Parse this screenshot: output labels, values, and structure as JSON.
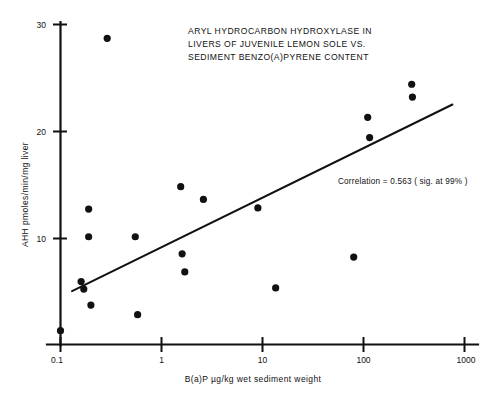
{
  "chart_data": {
    "type": "scatter",
    "title": "ARYL HYDROCARBON HYDROXYLASE IN LIVERS OF JUVENILE LEMON SOLE VS. SEDIMENT BENZO(A)PYRENE CONTENT",
    "title_lines": [
      "ARYL HYDROCARBON HYDROXYLASE IN",
      "LIVERS OF JUVENILE LEMON SOLE VS.",
      "SEDIMENT BENZO(A)PYRENE CONTENT"
    ],
    "xlabel": "B(a)P µg/kg wet sediment weight",
    "ylabel": "AHH  pmoles/min/mg liver",
    "xscale": "log",
    "yscale": "linear",
    "xlim": [
      0.1,
      1000
    ],
    "ylim": [
      0,
      30
    ],
    "xticks": [
      0.1,
      1,
      10,
      100,
      1000
    ],
    "xticklabels": [
      "0.1",
      "1",
      "10",
      "100",
      "1000"
    ],
    "yticks": [
      10,
      20,
      30
    ],
    "yticklabels": [
      "10",
      "20",
      "30"
    ],
    "grid": false,
    "legend": null,
    "annotation": "Correlation = 0.563 ( sig. at 99% )",
    "annotation_value": 0.563,
    "significance": "99%",
    "marker": "filled-circle",
    "marker_color": "#111111",
    "line_color": "#111111",
    "points": [
      {
        "x": 0.1,
        "y": 1.3
      },
      {
        "x": 0.16,
        "y": 5.9
      },
      {
        "x": 0.17,
        "y": 5.2
      },
      {
        "x": 0.19,
        "y": 12.7
      },
      {
        "x": 0.19,
        "y": 10.1
      },
      {
        "x": 0.2,
        "y": 3.7
      },
      {
        "x": 0.29,
        "y": 28.7
      },
      {
        "x": 0.55,
        "y": 10.1
      },
      {
        "x": 0.58,
        "y": 2.8
      },
      {
        "x": 1.55,
        "y": 14.8
      },
      {
        "x": 1.6,
        "y": 8.5
      },
      {
        "x": 1.7,
        "y": 6.8
      },
      {
        "x": 2.6,
        "y": 13.6
      },
      {
        "x": 9.0,
        "y": 12.8
      },
      {
        "x": 13.5,
        "y": 5.3
      },
      {
        "x": 80.0,
        "y": 8.2
      },
      {
        "x": 110.0,
        "y": 21.3
      },
      {
        "x": 115.0,
        "y": 19.4
      },
      {
        "x": 300.0,
        "y": 24.4
      },
      {
        "x": 305.0,
        "y": 23.2
      }
    ],
    "fit_line": {
      "label": "regression-line",
      "x_start": 0.13,
      "y_start": 5.0,
      "x_end": 760.0,
      "y_end": 22.5
    }
  },
  "figure": {
    "page_corner_mark": ""
  }
}
